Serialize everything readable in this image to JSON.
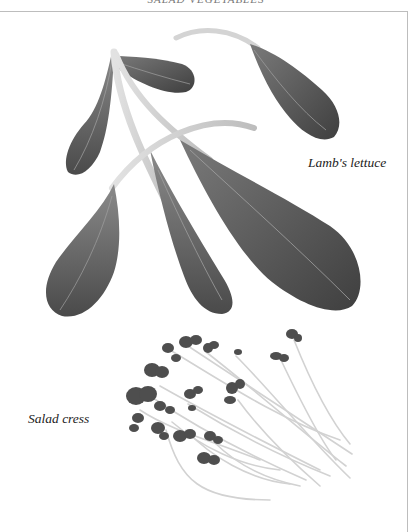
{
  "page": {
    "running_head": "SALAD VEGETABLES"
  },
  "captions": {
    "lambs_lettuce": "Lamb's lettuce",
    "salad_cress": "Salad cress"
  },
  "colors": {
    "leaf_dark": "#4a4a4a",
    "leaf_mid": "#6b6b6b",
    "stem": "#c8c8c8",
    "frame": "#bdbdbd"
  }
}
